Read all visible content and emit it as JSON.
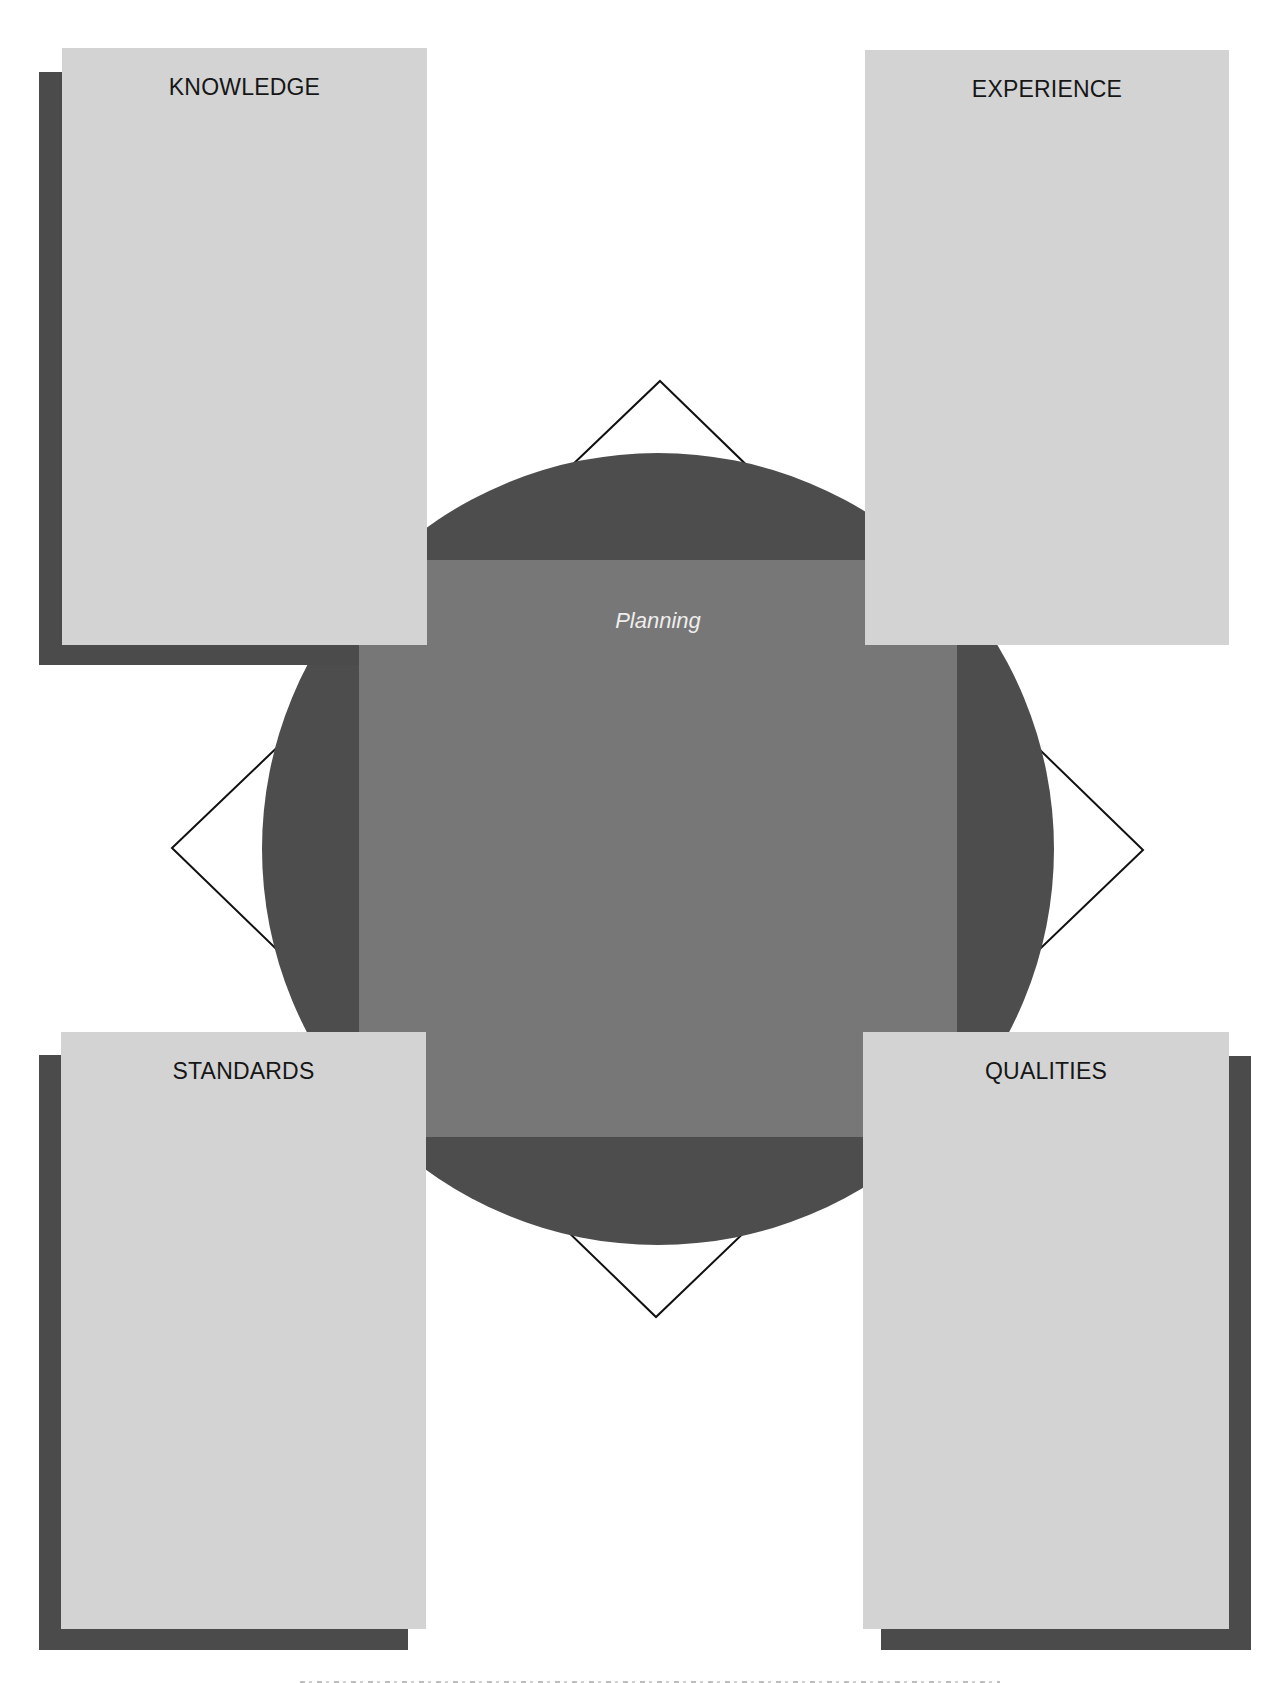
{
  "diagram": {
    "center": {
      "label": "Planning"
    },
    "panels": [
      {
        "id": "knowledge",
        "title": "KNOWLEDGE",
        "position": "top-left",
        "shadow": "bottom-left"
      },
      {
        "id": "experience",
        "title": "EXPERIENCE",
        "position": "top-right",
        "shadow": "none"
      },
      {
        "id": "standards",
        "title": "STANDARDS",
        "position": "bottom-left",
        "shadow": "bottom-left"
      },
      {
        "id": "qualities",
        "title": "QUALITIES",
        "position": "bottom-right",
        "shadow": "bottom-right"
      }
    ],
    "shapes": {
      "circle": {
        "cx": 658,
        "cy": 849,
        "r": 396
      },
      "diamond": {
        "top": [
          660,
          381
        ],
        "right": [
          1143,
          850
        ],
        "bottom": [
          656,
          1317
        ],
        "left": [
          172,
          848
        ]
      }
    },
    "caption": {
      "visible": "clipped",
      "text": ""
    }
  },
  "colors": {
    "panel_fill": "#d3d3d3",
    "panel_shadow": "#4b4b4b",
    "circle_fill": "#4d4d4d",
    "square_fill": "#777777",
    "diamond_stroke": "#111111",
    "title_text": "#161616",
    "center_text": "#eeeeee"
  }
}
